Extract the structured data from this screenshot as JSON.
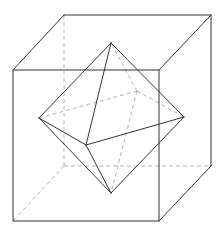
{
  "diagram": {
    "colors": {
      "solid_edge": "#333333",
      "hidden_edge": "#aaaaaa",
      "background": "#ffffff"
    },
    "cube": {
      "front_face": [
        [
          13,
          70
        ],
        [
          159,
          70
        ],
        [
          159,
          221
        ],
        [
          13,
          221
        ]
      ],
      "back_face": [
        [
          64,
          15
        ],
        [
          211,
          15
        ],
        [
          211,
          166
        ],
        [
          64,
          166
        ]
      ]
    },
    "octahedron": {
      "vertices": {
        "top": [
          111,
          43
        ],
        "bottom": [
          111,
          193
        ],
        "left": [
          39,
          118
        ],
        "right": [
          184,
          117
        ],
        "front": [
          86,
          145
        ],
        "back": [
          137,
          91
        ]
      }
    }
  }
}
